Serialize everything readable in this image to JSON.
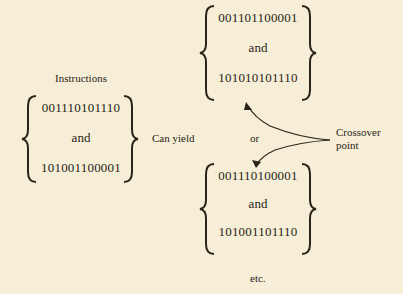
{
  "labels": {
    "instructions": "Instructions",
    "can_yield": "Can yield",
    "or": "or",
    "crossover": "Crossover",
    "point": "point",
    "etc": "etc."
  },
  "groups": {
    "parents": {
      "first": "001110101110",
      "conj": "and",
      "second": "101001100001"
    },
    "offspring_a": {
      "first": "001101100001",
      "conj": "and",
      "second": "101010101110"
    },
    "offspring_b": {
      "first": "001110100001",
      "conj": "and",
      "second": "101001101110"
    }
  },
  "colors": {
    "background": "#f6eed6",
    "ink": "#2a2418"
  }
}
